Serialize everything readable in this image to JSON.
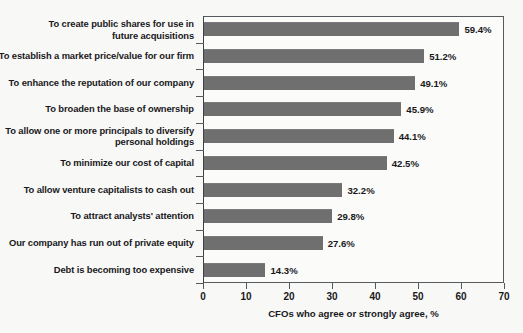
{
  "chart_data": {
    "type": "bar",
    "orientation": "horizontal",
    "title": "",
    "xlabel": "CFOs who agree or strongly agree, %",
    "ylabel": "",
    "xlim": [
      0,
      70
    ],
    "xticks": [
      "0",
      "10",
      "20",
      "30",
      "40",
      "50",
      "60",
      "70"
    ],
    "grid": false,
    "legend": null,
    "bar_color": "#6f6f6f",
    "categories": [
      "To create public shares for use in\nfuture acquisitions",
      "To establish a market price/value for our firm",
      "To enhance the reputation of our company",
      "To broaden the base of ownership",
      "To allow one or more principals to diversify\npersonal holdings",
      "To minimize our cost of capital",
      "To allow venture capitalists to cash out",
      "To attract analysts' attention",
      "Our company has run out of private equity",
      "Debt is becoming too expensive"
    ],
    "values": [
      59.4,
      51.2,
      49.1,
      45.9,
      44.1,
      42.5,
      32.2,
      29.8,
      27.6,
      14.3
    ],
    "value_labels": [
      "59.4%",
      "51.2%",
      "49.1%",
      "45.9%",
      "44.1%",
      "42.5%",
      "32.2%",
      "29.8%",
      "27.6%",
      "14.3%"
    ]
  }
}
